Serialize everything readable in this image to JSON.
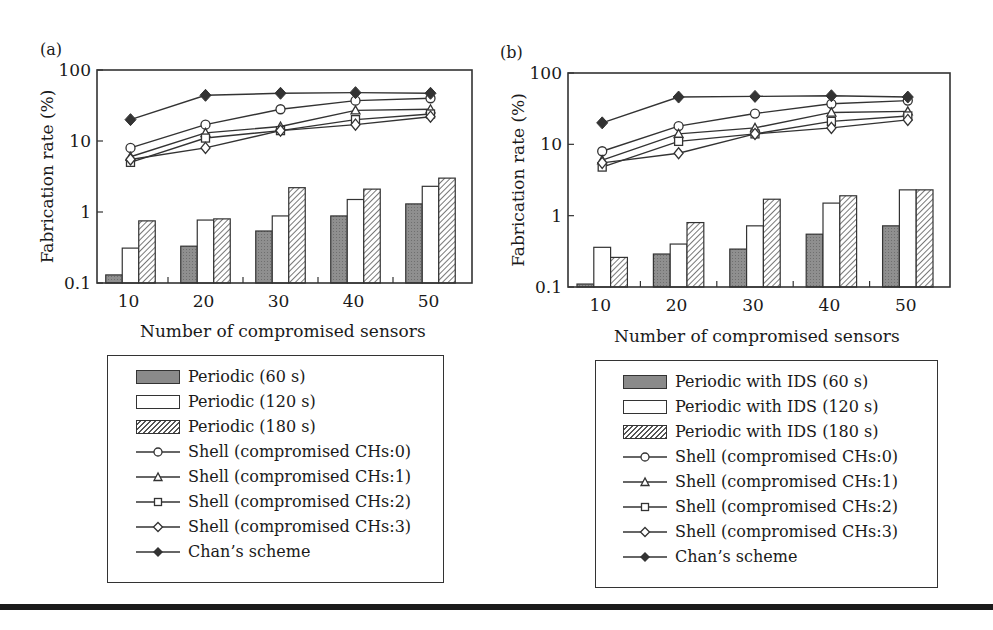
{
  "figure": {
    "panel_a_label": "(a)",
    "panel_b_label": "(b)",
    "ylabel": "Fabrication rate (%)",
    "xlabel": "Number of compromised sensors",
    "yticks": [
      "100",
      "10",
      "1",
      "0.1"
    ],
    "xticks": [
      "10",
      "20",
      "30",
      "40",
      "50"
    ]
  },
  "legend_a": {
    "items": [
      {
        "label": "Periodic (60 s)",
        "glyph": "bar-gray"
      },
      {
        "label": "Periodic (120 s)",
        "glyph": "bar-white"
      },
      {
        "label": "Periodic (180 s)",
        "glyph": "bar-hatched"
      },
      {
        "label": "Shell (compromised CHs:0)",
        "glyph": "circle"
      },
      {
        "label": "Shell (compromised CHs:1)",
        "glyph": "triangle"
      },
      {
        "label": "Shell (compromised CHs:2)",
        "glyph": "square"
      },
      {
        "label": "Shell (compromised CHs:3)",
        "glyph": "diamond-open"
      },
      {
        "label": "Chan’s scheme",
        "glyph": "diamond-filled"
      }
    ]
  },
  "legend_b": {
    "items": [
      {
        "label": "Periodic with IDS (60 s)",
        "glyph": "bar-gray"
      },
      {
        "label": "Periodic with IDS (120 s)",
        "glyph": "bar-white"
      },
      {
        "label": "Periodic with IDS (180 s)",
        "glyph": "bar-hatched"
      },
      {
        "label": "Shell (compromised CHs:0)",
        "glyph": "circle"
      },
      {
        "label": "Shell (compromised CHs:1)",
        "glyph": "triangle"
      },
      {
        "label": "Shell (compromised CHs:2)",
        "glyph": "square"
      },
      {
        "label": "Shell (compromised CHs:3)",
        "glyph": "diamond-open"
      },
      {
        "label": "Chan’s scheme",
        "glyph": "diamond-filled"
      }
    ]
  },
  "colors": {
    "bar_gray": "#8a8a8a",
    "line": "#333333",
    "frame": "#333333"
  },
  "chart_data": [
    {
      "type": "bar+line",
      "title": "(a)",
      "xlabel": "Number of compromised sensors",
      "ylabel": "Fabrication rate (%)",
      "yscale": "log",
      "ylim": [
        0.1,
        100
      ],
      "categories": [
        10,
        20,
        30,
        40,
        50
      ],
      "bar_series": [
        {
          "name": "Periodic (60 s)",
          "values": [
            0.13,
            0.33,
            0.54,
            0.88,
            1.3
          ]
        },
        {
          "name": "Periodic (120 s)",
          "values": [
            0.31,
            0.77,
            0.88,
            1.5,
            2.3
          ]
        },
        {
          "name": "Periodic (180 s)",
          "values": [
            0.75,
            0.8,
            2.2,
            2.1,
            3.0
          ]
        }
      ],
      "line_series": [
        {
          "name": "Shell (compromised CHs:0)",
          "marker": "circle",
          "values": [
            8,
            17,
            28,
            37,
            40
          ]
        },
        {
          "name": "Shell (compromised CHs:1)",
          "marker": "triangle",
          "values": [
            6,
            13,
            16,
            27,
            28
          ]
        },
        {
          "name": "Shell (compromised CHs:2)",
          "marker": "square",
          "values": [
            5,
            11,
            14,
            20,
            24
          ]
        },
        {
          "name": "Shell (compromised CHs:3)",
          "marker": "diamond-open",
          "values": [
            5.5,
            8,
            14,
            17,
            22
          ]
        },
        {
          "name": "Chan’s scheme",
          "marker": "diamond-filled",
          "values": [
            20,
            44,
            47,
            48,
            47
          ]
        }
      ],
      "legend_position": "below",
      "grid": false
    },
    {
      "type": "bar+line",
      "title": "(b)",
      "xlabel": "Number of compromised sensors",
      "ylabel": "Fabrication rate (%)",
      "yscale": "log",
      "ylim": [
        0.1,
        100
      ],
      "categories": [
        10,
        20,
        30,
        40,
        50
      ],
      "bar_series": [
        {
          "name": "Periodic with IDS (60 s)",
          "values": [
            0.11,
            0.29,
            0.34,
            0.55,
            0.72
          ]
        },
        {
          "name": "Periodic with IDS (120 s)",
          "values": [
            0.36,
            0.4,
            0.72,
            1.5,
            2.3
          ]
        },
        {
          "name": "Periodic with IDS (180 s)",
          "values": [
            0.26,
            0.8,
            1.7,
            1.9,
            2.3
          ]
        }
      ],
      "line_series": [
        {
          "name": "Shell (compromised CHs:0)",
          "marker": "circle",
          "values": [
            8,
            18,
            27,
            37,
            41
          ]
        },
        {
          "name": "Shell (compromised CHs:1)",
          "marker": "triangle",
          "values": [
            6,
            14,
            17,
            28,
            29
          ]
        },
        {
          "name": "Shell (compromised CHs:2)",
          "marker": "square",
          "values": [
            4.8,
            11,
            14,
            21,
            25
          ]
        },
        {
          "name": "Shell (compromised CHs:3)",
          "marker": "diamond-open",
          "values": [
            5.5,
            7.5,
            14,
            17,
            22
          ]
        },
        {
          "name": "Chan’s scheme",
          "marker": "diamond-filled",
          "values": [
            20,
            46,
            47,
            48,
            46
          ]
        }
      ],
      "legend_position": "below",
      "grid": false
    }
  ]
}
